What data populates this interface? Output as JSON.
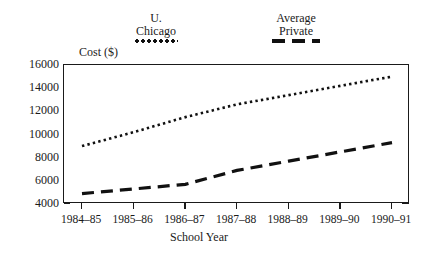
{
  "legend": {
    "entries": [
      {
        "name": "u-chicago",
        "line1": "U.",
        "line2": "Chicago",
        "marker": "dotted"
      },
      {
        "name": "average-private",
        "line1": "Average",
        "line2": "Private",
        "marker": "dashed"
      }
    ]
  },
  "axis": {
    "y_title": "Cost ($)",
    "x_title": "School Year"
  },
  "chart_data": {
    "type": "line",
    "title": "",
    "xlabel": "School Year",
    "ylabel": "Cost ($)",
    "categories": [
      "1984–85",
      "1985–86",
      "1986–87",
      "1987–88",
      "1988–89",
      "1989–90",
      "1990–91"
    ],
    "ylim": [
      4000,
      16000
    ],
    "ytick_labels": [
      "16000",
      "14000",
      "12000",
      "10000",
      "8000",
      "6000",
      "4000"
    ],
    "ytick_values": [
      16000,
      14000,
      12000,
      10000,
      8000,
      6000,
      4000
    ],
    "yminor_values": [
      15000,
      13000,
      11000,
      9000,
      7000,
      5000
    ],
    "grid": false,
    "legend_position": "top",
    "series": [
      {
        "name": "U. Chicago",
        "style": "dotted",
        "color": "#111111",
        "values": [
          9000,
          10200,
          11500,
          12600,
          13400,
          14200,
          15000
        ]
      },
      {
        "name": "Average Private",
        "style": "dashed",
        "color": "#111111",
        "values": [
          4900,
          5300,
          5700,
          6900,
          7700,
          8500,
          9300
        ]
      }
    ]
  }
}
